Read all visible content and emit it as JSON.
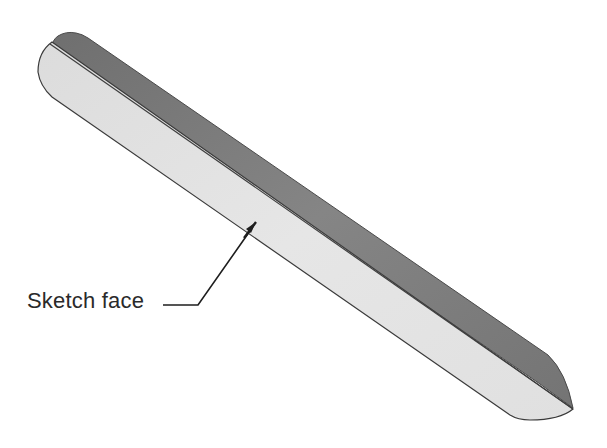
{
  "figure": {
    "callout": {
      "label": "Sketch face"
    },
    "colors": {
      "background": "#ffffff",
      "sketch_face": "#e2e2e2",
      "top_strip": "#7d7d7d",
      "edge_lines": "#3a3a3a",
      "arrow": "#1e1e1e"
    }
  }
}
